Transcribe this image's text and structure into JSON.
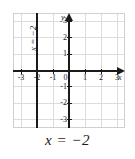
{
  "figure": {
    "caption": "x = −2",
    "background_color": "#ffffff",
    "grid_color": "#dcdcdc",
    "axis_color": "#1a1a1a",
    "line_color": "#1a1a1a"
  },
  "axes": {
    "x_axis_name": "x",
    "y_axis_name": "y",
    "x_tick_labels": [
      "-3",
      "-2",
      "-1",
      "0",
      "1",
      "2",
      "3"
    ],
    "y_tick_labels": [
      "3",
      "2",
      "1",
      "-1",
      "-2",
      "-3"
    ],
    "origin_label": "0"
  },
  "plotted_line": {
    "label": "x = −2",
    "rotated": true
  },
  "chart_data": {
    "type": "line",
    "title": "",
    "subtitle": "",
    "caption": "x = −2",
    "xlabel": "x",
    "ylabel": "y",
    "xlim": [
      -3.5,
      3.5
    ],
    "ylim": [
      -3.5,
      3.5
    ],
    "xticks": [
      -3,
      -2,
      -1,
      0,
      1,
      2,
      3
    ],
    "yticks": [
      -3,
      -2,
      -1,
      1,
      2,
      3
    ],
    "xtick_labels": [
      "-3",
      "-2",
      "-1",
      "0",
      "1",
      "2",
      "3"
    ],
    "ytick_labels": [
      "-3",
      "-2",
      "-1",
      "1",
      "2",
      "3"
    ],
    "grid": true,
    "grid_spacing": 1,
    "legend": null,
    "series": [
      {
        "name": "x = −2",
        "equation": "x = -2",
        "orientation": "vertical",
        "x": [
          -2,
          -2
        ],
        "y": [
          -3.5,
          3.5
        ],
        "annotation": "x = −2"
      }
    ]
  }
}
